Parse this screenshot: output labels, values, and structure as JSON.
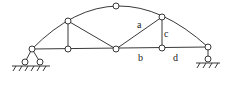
{
  "diagram": {
    "type": "three-hinged arch truss",
    "labels": {
      "a": "a",
      "b": "b",
      "c": "c",
      "d": "d"
    },
    "colors": {
      "stroke": "#222222",
      "background": "#ffffff"
    }
  }
}
